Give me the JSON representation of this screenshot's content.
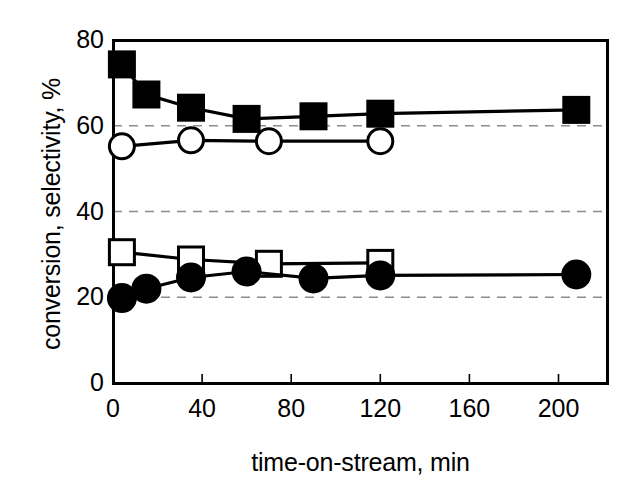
{
  "chart_data": {
    "type": "line",
    "title": "",
    "xlabel": "time-on-stream, min",
    "ylabel": "conversion, selectivity, %",
    "xlim": [
      0,
      222
    ],
    "ylim": [
      0,
      80
    ],
    "xticks": [
      0,
      40,
      80,
      120,
      160,
      200
    ],
    "yticks": [
      0,
      20,
      40,
      60,
      80
    ],
    "grid": "horizontal-dashed",
    "gridlines": [
      20,
      40,
      60
    ],
    "legend": "none",
    "series": [
      {
        "name": "filled-square",
        "marker": "filled-square",
        "color": "#000000",
        "points": [
          {
            "x": 4,
            "y": 74.3
          },
          {
            "x": 15,
            "y": 67.3
          },
          {
            "x": 35,
            "y": 64.2
          },
          {
            "x": 60,
            "y": 61.6
          },
          {
            "x": 90,
            "y": 62.2
          },
          {
            "x": 120,
            "y": 62.8
          },
          {
            "x": 208,
            "y": 63.7
          }
        ]
      },
      {
        "name": "open-circle",
        "marker": "open-circle",
        "color": "#000000",
        "points": [
          {
            "x": 4,
            "y": 55.2
          },
          {
            "x": 35,
            "y": 56.6
          },
          {
            "x": 70,
            "y": 56.4
          },
          {
            "x": 120,
            "y": 56.4
          }
        ]
      },
      {
        "name": "open-square",
        "marker": "open-square",
        "color": "#000000",
        "points": [
          {
            "x": 4,
            "y": 30.5
          },
          {
            "x": 35,
            "y": 28.8
          },
          {
            "x": 70,
            "y": 27.8
          },
          {
            "x": 120,
            "y": 28.0
          }
        ]
      },
      {
        "name": "filled-circle",
        "marker": "filled-circle",
        "color": "#000000",
        "points": [
          {
            "x": 4,
            "y": 19.8
          },
          {
            "x": 15,
            "y": 22.0
          },
          {
            "x": 35,
            "y": 24.6
          },
          {
            "x": 60,
            "y": 26.0
          },
          {
            "x": 90,
            "y": 24.4
          },
          {
            "x": 120,
            "y": 25.1
          },
          {
            "x": 208,
            "y": 25.3
          }
        ]
      }
    ]
  },
  "axes": {
    "frame_color": "#000000",
    "grid_color": "#8c8c8c"
  }
}
